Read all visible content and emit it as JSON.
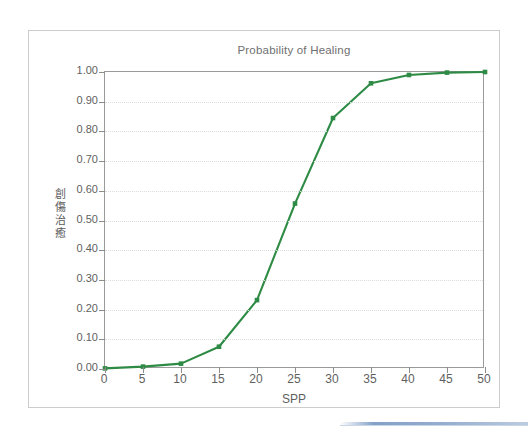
{
  "figure": {
    "title": "Probability of Healing",
    "axis_color": "#9a9a9a",
    "grid_color": "#dcdcdc",
    "series_color": "#2e8b45"
  },
  "chart_data": {
    "type": "line",
    "title": "Probability of Healing",
    "xlabel": "SPP",
    "ylabel": "創傷治癒",
    "ylabel_chars": [
      "創",
      "傷",
      "治",
      "癒"
    ],
    "xlim": [
      0,
      50
    ],
    "ylim": [
      0.0,
      1.0
    ],
    "xticks": [
      0,
      5,
      10,
      15,
      20,
      25,
      30,
      35,
      40,
      45,
      50
    ],
    "xtick_labels": [
      "0",
      "5",
      "10",
      "15",
      "20",
      "25",
      "30",
      "35",
      "40",
      "45",
      "50"
    ],
    "yticks": [
      0.0,
      0.1,
      0.2,
      0.3,
      0.4,
      0.5,
      0.6,
      0.7,
      0.8,
      0.9,
      1.0
    ],
    "ytick_labels": [
      "0.00",
      "0.10",
      "0.20",
      "0.30",
      "0.40",
      "0.50",
      "0.60",
      "0.70",
      "0.80",
      "0.90",
      "1.00"
    ],
    "grid": "horizontal-dotted",
    "legend": "none",
    "marker": "square",
    "x": [
      0,
      5,
      10,
      15,
      20,
      25,
      30,
      35,
      40,
      45,
      50
    ],
    "values": [
      0.002,
      0.008,
      0.018,
      0.075,
      0.232,
      0.557,
      0.845,
      0.962,
      0.99,
      0.998,
      1.0
    ],
    "series": [
      {
        "name": "Probability of Healing",
        "color": "#2e8b45",
        "values": [
          0.002,
          0.008,
          0.018,
          0.075,
          0.232,
          0.557,
          0.845,
          0.962,
          0.99,
          0.998,
          1.0
        ]
      }
    ]
  },
  "decoration": {
    "blue_rule_color": "#8fa9cd"
  }
}
